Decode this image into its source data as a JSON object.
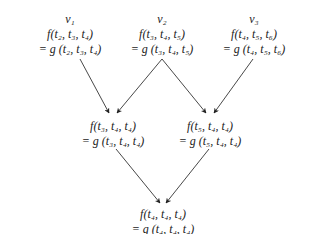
{
  "diagram": {
    "top_nodes": [
      {
        "label": "v₁",
        "f": "f(t₂, t₃, t₄)",
        "g": "= g (t₂, t₃, t₄)"
      },
      {
        "label": "v₂",
        "f": "f(t₃, t₄, t₅)",
        "g": "= g (t₃, t₄, t₅)"
      },
      {
        "label": "v₃",
        "f": "f(t₄, t₅, t₆)",
        "g": "= g (t₄, t₅, t₆)"
      }
    ],
    "middle_nodes": [
      {
        "f": "f(t₃, t₄, t₄)",
        "g": "= g (t₃, t₄, t₄)"
      },
      {
        "f": "f(t₅, t₄, t₄)",
        "g": "= g (t₅, t₄, t₄)"
      }
    ],
    "bottom_node": {
      "f": "f(t₄, t₄, t₄)",
      "g": "= g (t₄, t₄, t₄)"
    },
    "edges": [
      {
        "from": "v1",
        "to": "middle-left"
      },
      {
        "from": "v2",
        "to": "middle-left"
      },
      {
        "from": "v2",
        "to": "middle-right"
      },
      {
        "from": "v3",
        "to": "middle-right"
      },
      {
        "from": "middle-left",
        "to": "bottom"
      },
      {
        "from": "middle-right",
        "to": "bottom"
      }
    ]
  }
}
